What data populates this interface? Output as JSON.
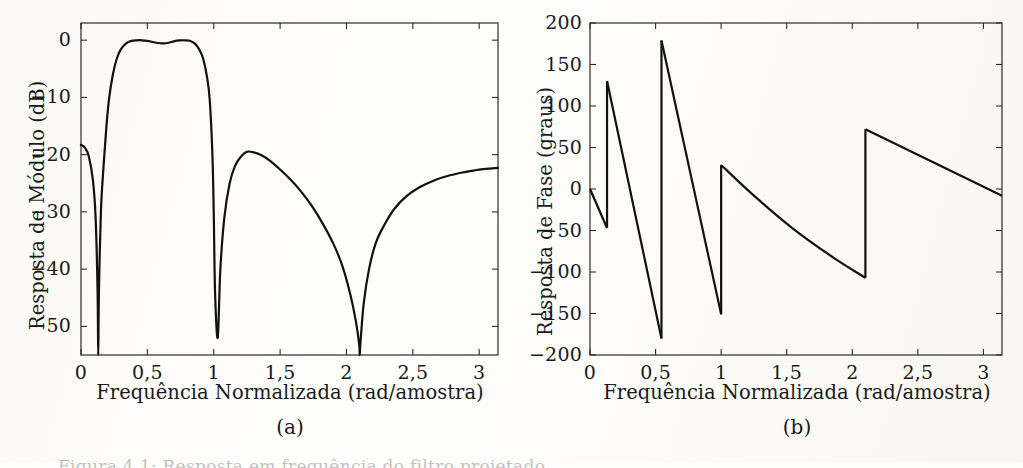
{
  "figure": {
    "language": "pt-BR",
    "bottom_caption_partial": "Figura 4.1: Resposta em frequência do filtro projetado"
  },
  "panels": [
    {
      "id": "a",
      "subcaption": "(a)",
      "xlabel": "Frequência Normalizada (rad/amostra)",
      "ylabel": "Resposta de Módulo (dB)"
    },
    {
      "id": "b",
      "subcaption": "(b)",
      "xlabel": "Frequência Normalizada (rad/amostra)",
      "ylabel": "Resposta de Fase (graus)"
    }
  ],
  "chart_data": [
    {
      "type": "line",
      "id": "magnitude-response",
      "title": "",
      "xlabel": "Frequência Normalizada (rad/amostra)",
      "ylabel": "Resposta de Módulo (dB)",
      "xlim": [
        0,
        3.1416
      ],
      "ylim": [
        -55,
        3
      ],
      "xticks": [
        0,
        0.5,
        1,
        1.5,
        2,
        2.5,
        3
      ],
      "xticklabels": [
        "0",
        "0,5",
        "1",
        "1,5",
        "2",
        "2,5",
        "3"
      ],
      "yticks": [
        0,
        -10,
        -20,
        -30,
        -40,
        -50
      ],
      "yticklabels": [
        "0",
        "-10",
        "-20",
        "-30",
        "-40",
        "-50"
      ],
      "grid": false,
      "legend": null,
      "notes": [
        "Filtro passa-faixa FIR; três nulos profundos",
        "Banda de passagem equiripple em 0 dB entre ~0,25 e ~0,85 rad",
        "Lóbulo de rejeição máximo ~ -19,5 dB em ~1,25 rad"
      ],
      "features": {
        "nulls_rad": [
          0.13,
          1.0,
          2.1
        ],
        "passband_rad": [
          0.25,
          0.85
        ],
        "passband_ripple_db": [
          0.0,
          -0.55,
          0.0
        ],
        "sidelobe_peak_rad": 1.25,
        "sidelobe_peak_db": -19.5,
        "value_at_zero_db": -18.3,
        "value_at_pi_db": -22.3
      },
      "x": [
        0.0,
        0.03,
        0.06,
        0.09,
        0.11,
        0.125,
        0.13,
        0.135,
        0.15,
        0.17,
        0.19,
        0.21,
        0.24,
        0.27,
        0.3,
        0.34,
        0.38,
        0.42,
        0.46,
        0.5,
        0.54,
        0.58,
        0.62,
        0.66,
        0.7,
        0.74,
        0.78,
        0.82,
        0.86,
        0.89,
        0.92,
        0.95,
        0.97,
        0.99,
        1.0,
        1.01,
        1.03,
        1.05,
        1.08,
        1.12,
        1.16,
        1.2,
        1.25,
        1.3,
        1.36,
        1.42,
        1.5,
        1.58,
        1.66,
        1.74,
        1.82,
        1.9,
        1.97,
        2.03,
        2.07,
        2.095,
        2.1,
        2.105,
        2.13,
        2.17,
        2.22,
        2.28,
        2.36,
        2.45,
        2.55,
        2.66,
        2.78,
        2.9,
        3.0,
        3.1,
        3.1416
      ],
      "y": [
        -18.3,
        -18.8,
        -20.4,
        -24.5,
        -31.0,
        -44.0,
        -56.0,
        -44.0,
        -30.0,
        -22.0,
        -15.5,
        -10.5,
        -6.0,
        -3.2,
        -1.6,
        -0.55,
        -0.12,
        -0.02,
        -0.02,
        -0.12,
        -0.32,
        -0.5,
        -0.55,
        -0.45,
        -0.2,
        -0.05,
        -0.02,
        -0.1,
        -0.65,
        -1.6,
        -3.2,
        -6.5,
        -10.5,
        -20.0,
        -30.0,
        -44.0,
        -52.0,
        -40.0,
        -31.0,
        -25.0,
        -22.0,
        -20.5,
        -19.5,
        -19.6,
        -20.1,
        -21.0,
        -22.6,
        -24.4,
        -26.5,
        -29.0,
        -32.0,
        -35.5,
        -39.5,
        -44.5,
        -49.0,
        -53.0,
        -56.0,
        -53.0,
        -46.0,
        -40.0,
        -35.5,
        -32.5,
        -29.5,
        -27.3,
        -25.7,
        -24.5,
        -23.6,
        -23.0,
        -22.6,
        -22.4,
        -22.3
      ]
    },
    {
      "type": "line",
      "id": "phase-response",
      "title": "",
      "xlabel": "Frequência Normalizada (rad/amostra)",
      "ylabel": "Resposta de Fase (graus)",
      "xlim": [
        0,
        3.1416
      ],
      "ylim": [
        -200,
        200
      ],
      "xticks": [
        0,
        0.5,
        1,
        1.5,
        2,
        2.5,
        3
      ],
      "xticklabels": [
        "0",
        "0,5",
        "1",
        "1,5",
        "2",
        "2,5",
        "3"
      ],
      "yticks": [
        200,
        150,
        100,
        50,
        0,
        -50,
        -100,
        -150,
        -200
      ],
      "yticklabels": [
        "200",
        "150",
        "100",
        "50",
        "0",
        "-50",
        "-100",
        "-150",
        "-200"
      ],
      "grid": false,
      "legend": null,
      "notes": [
        "Fase enrolada (wrapped) em graus",
        "Saltos de 180° coincidem com os nulos do módulo"
      ],
      "features": {
        "jumps_rad": [
          0.13,
          0.545,
          1.0,
          2.1
        ],
        "start_deg": 0,
        "end_deg": -8
      },
      "segments": [
        {
          "x": [
            0.0,
            0.13
          ],
          "y": [
            0,
            -47
          ]
        },
        {
          "x": [
            0.13,
            0.545
          ],
          "y": [
            130,
            -180
          ]
        },
        {
          "x": [
            0.545,
            1.0
          ],
          "y": [
            179,
            -151
          ]
        },
        {
          "x": [
            1.0,
            1.25,
            1.55,
            1.85,
            2.1
          ],
          "y": [
            29,
            -8,
            -48,
            -82,
            -107
          ]
        },
        {
          "x": [
            2.1,
            3.1416
          ],
          "y": [
            72,
            -8
          ]
        }
      ]
    }
  ]
}
